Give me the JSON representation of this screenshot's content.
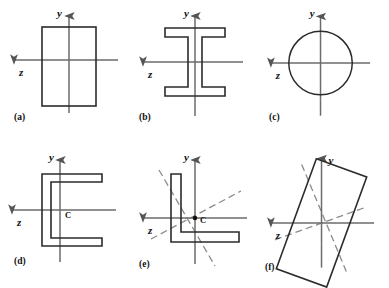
{
  "figure": {
    "axis_color": "#6b6b6b",
    "outline_color": "#2b2b2b",
    "dashed_color": "#8a8a8a",
    "background": "#ffffff",
    "axis_labels": {
      "y": "y",
      "z": "z"
    },
    "centroid_label": "C"
  },
  "panels": [
    {
      "id": "a",
      "caption": "(a)",
      "shape": "rectangle",
      "has_centroid_label": false,
      "has_principal_axes": false,
      "y_label": "y",
      "z_label": "z"
    },
    {
      "id": "b",
      "caption": "(b)",
      "shape": "wide-flange-i-beam",
      "has_centroid_label": false,
      "has_principal_axes": false,
      "y_label": "y",
      "z_label": "z"
    },
    {
      "id": "c",
      "caption": "(c)",
      "shape": "circle",
      "has_centroid_label": false,
      "has_principal_axes": false,
      "y_label": "y",
      "z_label": "z"
    },
    {
      "id": "d",
      "caption": "(d)",
      "shape": "channel",
      "has_centroid_label": true,
      "centroid_label": "C",
      "has_principal_axes": false,
      "y_label": "y",
      "z_label": "z"
    },
    {
      "id": "e",
      "caption": "(e)",
      "shape": "angle",
      "has_centroid_label": true,
      "centroid_label": "C",
      "has_principal_axes": true,
      "principal_axis_angles_deg": [
        28,
        -62
      ],
      "y_label": "y",
      "z_label": "z"
    },
    {
      "id": "f",
      "caption": "(f)",
      "shape": "tilted-rectangle",
      "tilt_deg": 20,
      "has_centroid_label": false,
      "has_principal_axes": true,
      "principal_axis_angles_deg": [
        -20,
        70
      ],
      "y_label": "y",
      "z_label": "z"
    }
  ]
}
